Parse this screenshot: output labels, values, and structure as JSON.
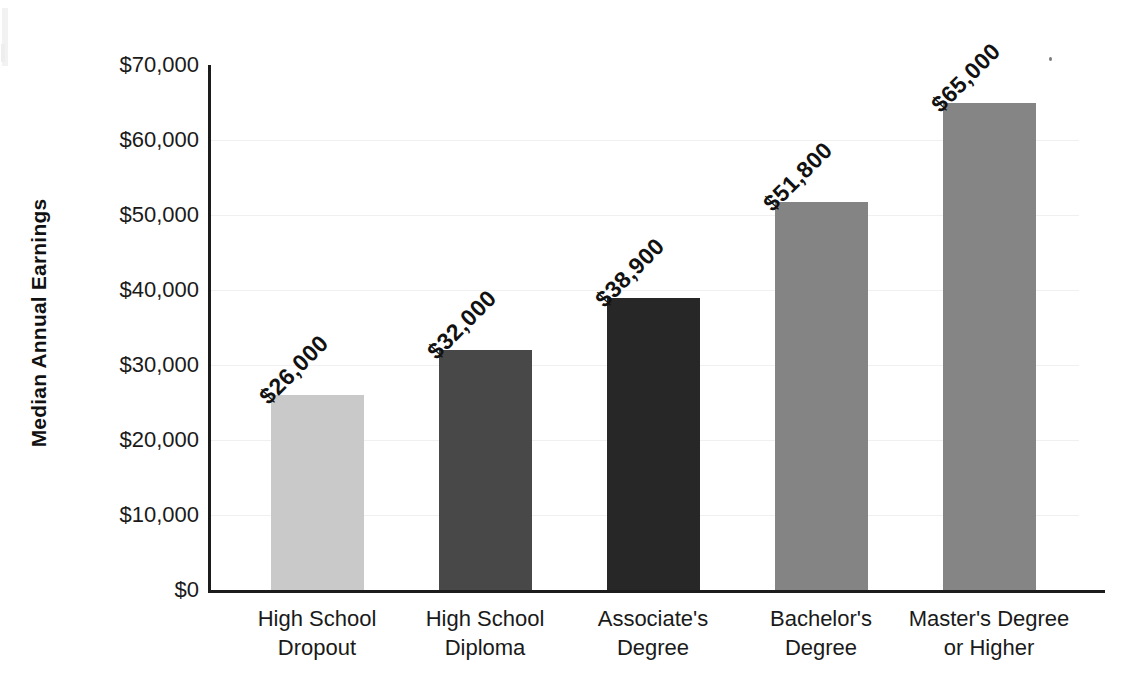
{
  "chart_data": {
    "type": "bar",
    "title": "",
    "xlabel": "",
    "ylabel": "Median Annual Earnings",
    "ylim": [
      0,
      70000
    ],
    "grid": true,
    "legend": "none",
    "orientation": "vertical",
    "value_label_rotation_deg": -45,
    "categories": [
      "High School Dropout",
      "High School Diploma",
      "Associate's Degree",
      "Bachelor's Degree",
      "Master's Degree or Higher"
    ],
    "category_lines": [
      [
        "High School",
        "Dropout"
      ],
      [
        "High School",
        "Diploma"
      ],
      [
        "Associate's",
        "Degree"
      ],
      [
        "Bachelor's",
        "Degree"
      ],
      [
        "Master's Degree",
        "or Higher"
      ]
    ],
    "values": [
      26000,
      32000,
      38900,
      51800,
      65000
    ],
    "value_labels": [
      "$26,000",
      "$32,000",
      "$38,900",
      "$51,800",
      "$65,000"
    ],
    "bar_colors": [
      "#c9c9c9",
      "#484848",
      "#272727",
      "#848484",
      "#858585"
    ],
    "yticks": [
      0,
      10000,
      20000,
      30000,
      40000,
      50000,
      60000,
      70000
    ],
    "ytick_labels": [
      "$0",
      "$10,000",
      "$20,000",
      "$30,000",
      "$40,000",
      "$50,000",
      "$60,000",
      "$70,000"
    ]
  },
  "axis": {
    "line_color": "#1c1c1c",
    "grid_color": "#f0f0f0"
  },
  "background": "#ffffff"
}
